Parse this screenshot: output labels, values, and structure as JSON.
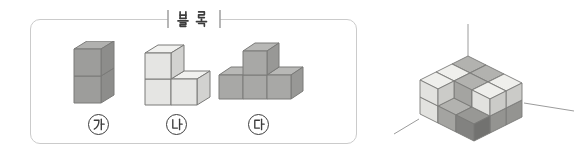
{
  "panel": {
    "title": "블록",
    "blocks": [
      {
        "id": "ga",
        "label": "가",
        "shade": "block_ga",
        "cube_size": 27,
        "depth": [
          13,
          -8
        ],
        "origin": [
          3,
          62
        ],
        "cubes": [
          [
            0,
            0
          ],
          [
            0,
            1
          ]
        ],
        "cube_count": 2
      },
      {
        "id": "na",
        "label": "나",
        "shade": "block_na",
        "cube_size": 26,
        "depth": [
          13,
          -8
        ],
        "origin": [
          4,
          64
        ],
        "cubes": [
          [
            0,
            0
          ],
          [
            1,
            0
          ],
          [
            0,
            1
          ]
        ],
        "cube_count": 3
      },
      {
        "id": "da",
        "label": "다",
        "shade": "block_da",
        "cube_size": 24,
        "depth": [
          12,
          -8
        ],
        "origin": [
          4,
          57
        ],
        "cubes": [
          [
            0,
            0
          ],
          [
            1,
            0
          ],
          [
            2,
            0
          ],
          [
            1,
            1
          ]
        ],
        "cube_count": 4
      }
    ]
  },
  "target_structure": {
    "description": "3x3 two-layer cube stack in a room corner; top-layer front-center and front-right cubes missing",
    "grid": {
      "rows": 3,
      "cols": 3,
      "layers": 2
    },
    "missing_top_cubes": [
      [
        3,
        2
      ],
      [
        3,
        3
      ]
    ],
    "cubes": [
      {
        "r": 1,
        "c": 1,
        "z": 0,
        "shade": "medium"
      },
      {
        "r": 1,
        "c": 2,
        "z": 0,
        "shade": "medium"
      },
      {
        "r": 1,
        "c": 3,
        "z": 0,
        "shade": "medium"
      },
      {
        "r": 2,
        "c": 1,
        "z": 0,
        "shade": "light"
      },
      {
        "r": 2,
        "c": 2,
        "z": 0,
        "shade": "medium"
      },
      {
        "r": 2,
        "c": 3,
        "z": 0,
        "shade": "medium"
      },
      {
        "r": 3,
        "c": 1,
        "z": 0,
        "shade": "light"
      },
      {
        "r": 3,
        "c": 2,
        "z": 0,
        "shade": "medium"
      },
      {
        "r": 3,
        "c": 3,
        "z": 0,
        "shade": "dark"
      },
      {
        "r": 1,
        "c": 1,
        "z": 1,
        "shade": "medium"
      },
      {
        "r": 1,
        "c": 2,
        "z": 1,
        "shade": "medium"
      },
      {
        "r": 1,
        "c": 3,
        "z": 1,
        "shade": "light"
      },
      {
        "r": 2,
        "c": 1,
        "z": 1,
        "shade": "light"
      },
      {
        "r": 2,
        "c": 2,
        "z": 1,
        "shade": "medium"
      },
      {
        "r": 2,
        "c": 3,
        "z": 1,
        "shade": "light"
      },
      {
        "r": 3,
        "c": 1,
        "z": 1,
        "shade": "light"
      }
    ],
    "axis_lines": [
      {
        "x1": 90,
        "y1": 10,
        "x2": 90,
        "y2": 42
      },
      {
        "x1": 146,
        "y1": 89,
        "x2": 196,
        "y2": 97
      },
      {
        "x1": 41,
        "y1": 105,
        "x2": 16,
        "y2": 120
      }
    ]
  },
  "palette": {
    "shades": {
      "light": {
        "top": "#efefec",
        "front": "#e2e2df",
        "right": "#cbcbc8"
      },
      "medium": {
        "top": "#b2b2af",
        "front": "#a4a4a1",
        "right": "#949491"
      },
      "dark": {
        "top": "#989895",
        "front": "#828280",
        "right": "#727270"
      },
      "block_ga": {
        "top": "#b1b1af",
        "front": "#9d9d9b",
        "right": "#8d8d8b"
      },
      "block_na": {
        "top": "#f1f1ef",
        "front": "#e5e5e3",
        "right": "#d2d2d0"
      },
      "block_da": {
        "top": "#b8b8b6",
        "front": "#a8a8a6",
        "right": "#989896"
      }
    },
    "edge": "#7a7a78",
    "box_border": "#cbcbcb",
    "tick": "#6f6f6f",
    "text": "#3c3c3c",
    "axis_line": "#9c9c9c"
  }
}
